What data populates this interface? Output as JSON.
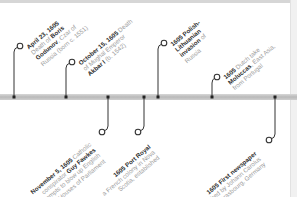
{
  "timeline": {
    "axis_color": "#c4c4c4",
    "line_color": "#333333",
    "text_color": "#9a9a9a",
    "emphasis_color": "#2b2b2b",
    "events_above": [
      {
        "date": "April 23, 1605",
        "lines": [
          "Death of ",
          "Boris",
          " Godunov",
          ", Czar of",
          "Russia (born c. 1551)"
        ],
        "line1_pre": "",
        "line2_pre": "Death of ",
        "line2_bold": "Boris",
        "line3_bold": "Godunov",
        "line3_post": ", Czar of",
        "line4": "Russia (born c. 1551)"
      },
      {
        "date": "October 15, 1605",
        "line1_post": " Death",
        "line2": "of Mughal Emperor",
        "line3_bold": "Akbar I",
        "line3_post": " (b. 1542)"
      },
      {
        "date": "1605",
        "line1_bold": " Polish-",
        "line2_bold": "Lithuanian",
        "line3_bold": "invasion",
        "line3_post": " of",
        "line4": "Russia"
      },
      {
        "date": "1605",
        "line1_post": " Dutch take",
        "line2_bold": "Moluccas",
        "line2_post": ", East Asia,",
        "line3": "from Portugal"
      }
    ],
    "events_below": [
      {
        "date": "November 5, 1605",
        "line1_post": " Catholic",
        "line2_pre": "conspirator ",
        "line2_bold": "Guy Fawkes",
        "line3": "attempts to blow up English",
        "line4": "Houses of Parliament"
      },
      {
        "date": "1605",
        "line1_bold": " Port Royal",
        "line2": "a French colony in Nova",
        "line3": "Scotia, established"
      },
      {
        "date": "1605",
        "line1_bold": " First newspaper",
        "line2": "published by Johann Carolus",
        "line3": "in Strasbourg, Germany"
      }
    ]
  }
}
